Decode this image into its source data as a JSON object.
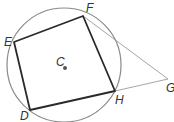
{
  "diagram": {
    "type": "inscribed-quadrilateral-with-tangents",
    "colors": {
      "circle": "#8a8a8a",
      "quadrilateral": "#2a2a2a",
      "tangent": "#9a9a9a",
      "label": "#333333",
      "center_dot": "#555555"
    },
    "circle": {
      "cx": 64,
      "cy": 65,
      "r": 57
    },
    "center": {
      "label": "C",
      "x": 65,
      "y": 68
    },
    "points": {
      "E": {
        "x": 14,
        "y": 42
      },
      "F": {
        "x": 83,
        "y": 16
      },
      "H": {
        "x": 115,
        "y": 91
      },
      "D": {
        "x": 30,
        "y": 110
      },
      "G": {
        "x": 168,
        "y": 79
      }
    },
    "labels": [
      {
        "text": "E",
        "x": 4,
        "y": 46
      },
      {
        "text": "F",
        "x": 86,
        "y": 12
      },
      {
        "text": "C",
        "x": 56,
        "y": 66
      },
      {
        "text": "H",
        "x": 115,
        "y": 104
      },
      {
        "text": "D",
        "x": 20,
        "y": 120
      },
      {
        "text": "G",
        "x": 166,
        "y": 92
      }
    ]
  }
}
